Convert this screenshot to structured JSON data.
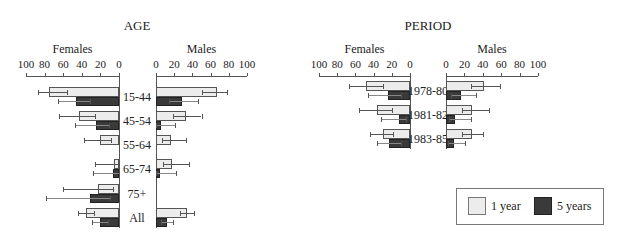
{
  "chart_data": [
    {
      "type": "bar",
      "orientation": "horizontal-population-pyramid",
      "title": "AGE",
      "panels": [
        "Females",
        "Males"
      ],
      "axis_ticks": [
        100,
        80,
        60,
        40,
        20,
        0
      ],
      "xlim": [
        0,
        100
      ],
      "categories": [
        "15-44",
        "45-54",
        "55-64",
        "65-74",
        "75+",
        "All"
      ],
      "series": [
        {
          "name": "1 year",
          "sex": "Females",
          "values": [
            75,
            43,
            20,
            5,
            23,
            35
          ],
          "err_low": [
            56,
            26,
            9,
            0,
            6,
            27
          ],
          "err_high": [
            87,
            64,
            38,
            26,
            60,
            44
          ]
        },
        {
          "name": "5 years",
          "sex": "Females",
          "values": [
            46,
            25,
            0,
            6,
            31,
            20
          ],
          "err_low": [
            31,
            11,
            0,
            0,
            10,
            12
          ],
          "err_high": [
            66,
            47,
            0,
            28,
            78,
            29
          ]
        },
        {
          "name": "1 year",
          "sex": "Males",
          "values": [
            67,
            33,
            16,
            18,
            0,
            34
          ],
          "err_low": [
            51,
            19,
            7,
            8,
            0,
            26
          ],
          "err_high": [
            78,
            50,
            33,
            36,
            0,
            42
          ]
        },
        {
          "name": "5 years",
          "sex": "Males",
          "values": [
            29,
            6,
            0,
            4,
            0,
            12
          ],
          "err_low": [
            14,
            0,
            0,
            0,
            0,
            6
          ],
          "err_high": [
            46,
            21,
            0,
            22,
            0,
            19
          ]
        }
      ]
    },
    {
      "type": "bar",
      "orientation": "horizontal-population-pyramid",
      "title": "PERIOD",
      "panels": [
        "Females",
        "Males"
      ],
      "axis_ticks": [
        100,
        80,
        60,
        40,
        20,
        0
      ],
      "xlim": [
        0,
        100
      ],
      "categories": [
        "1978-80",
        "1981-82",
        "1983-85"
      ],
      "series": [
        {
          "name": "1 year",
          "sex": "Females",
          "values": [
            48,
            36,
            30
          ],
          "err_low": [
            30,
            20,
            19
          ],
          "err_high": [
            67,
            56,
            44
          ]
        },
        {
          "name": "5 years",
          "sex": "Females",
          "values": [
            24,
            12,
            23
          ],
          "err_low": [
            10,
            4,
            10
          ],
          "err_high": [
            46,
            32,
            36
          ]
        },
        {
          "name": "1 year",
          "sex": "Males",
          "values": [
            41,
            28,
            28
          ],
          "err_low": [
            27,
            17,
            17
          ],
          "err_high": [
            59,
            47,
            40
          ]
        },
        {
          "name": "5 years",
          "sex": "Males",
          "values": [
            16,
            10,
            9
          ],
          "err_low": [
            5,
            3,
            2
          ],
          "err_high": [
            33,
            27,
            21
          ]
        }
      ]
    }
  ],
  "legend": {
    "items": [
      {
        "label": "1 year",
        "color": "#ececec"
      },
      {
        "label": "5 years",
        "color": "#3a3a3a"
      }
    ]
  },
  "labels": {
    "age_title": "AGE",
    "period_title": "PERIOD",
    "females": "Females",
    "males": "Males"
  }
}
